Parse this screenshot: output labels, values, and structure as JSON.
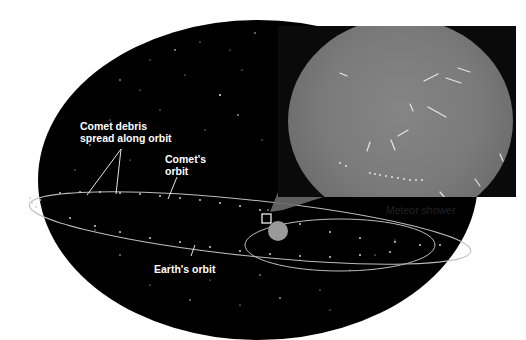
{
  "figure": {
    "labels": {
      "comet_debris": [
        "Comet debris",
        "spread along orbit"
      ],
      "comets_orbit": [
        "Comet's",
        "orbit"
      ],
      "earths_orbit": "Earth's orbit",
      "meteor_shower": "Meteor shower"
    },
    "elements": {
      "starfield": "star-field background",
      "comet_orbit": "elongated ellipse with debris dots",
      "earth_orbit": "ellipse on right",
      "earth": "grey sphere at intersection",
      "inset_photo": "all-sky meteor shower photograph"
    },
    "colors": {
      "sky": "#000000",
      "orbit_line": "#bdbdbd",
      "label_text": "#ffffff",
      "caption_text": "#222222",
      "photo_sky": "#7a7a7a"
    }
  }
}
